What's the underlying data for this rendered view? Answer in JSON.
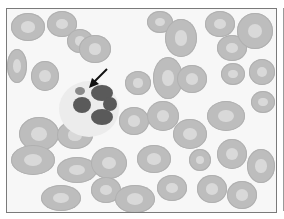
{
  "image": {
    "type": "micrograph",
    "description": "Grayscale blood smear showing red blood cells and a multilobed neutrophil with an arrow pointing to a small body adjacent to the nucleus",
    "annotation": {
      "kind": "arrow",
      "target": "small-inclusion-near-neutrophil"
    },
    "colors": {
      "background": "#f7f7f7",
      "rbc": "#bdbdbd",
      "nucleus": "#5a5a5a",
      "frame": "#7a7a7a"
    }
  },
  "cells": [
    {
      "x": 4,
      "y": 4,
      "w": 34,
      "h": 28
    },
    {
      "x": 40,
      "y": 2,
      "w": 30,
      "h": 26
    },
    {
      "x": 60,
      "y": 20,
      "w": 26,
      "h": 24
    },
    {
      "x": 72,
      "y": 26,
      "w": 32,
      "h": 28
    },
    {
      "x": 0,
      "y": 40,
      "w": 20,
      "h": 34
    },
    {
      "x": 24,
      "y": 52,
      "w": 28,
      "h": 30
    },
    {
      "x": 140,
      "y": 2,
      "w": 26,
      "h": 22
    },
    {
      "x": 158,
      "y": 10,
      "w": 32,
      "h": 38
    },
    {
      "x": 198,
      "y": 2,
      "w": 30,
      "h": 26
    },
    {
      "x": 210,
      "y": 26,
      "w": 30,
      "h": 26
    },
    {
      "x": 230,
      "y": 4,
      "w": 36,
      "h": 36
    },
    {
      "x": 214,
      "y": 54,
      "w": 24,
      "h": 22
    },
    {
      "x": 242,
      "y": 50,
      "w": 26,
      "h": 26
    },
    {
      "x": 244,
      "y": 82,
      "w": 24,
      "h": 22
    },
    {
      "x": 118,
      "y": 62,
      "w": 26,
      "h": 24
    },
    {
      "x": 146,
      "y": 48,
      "w": 30,
      "h": 42
    },
    {
      "x": 170,
      "y": 56,
      "w": 30,
      "h": 28
    },
    {
      "x": 112,
      "y": 98,
      "w": 30,
      "h": 28
    },
    {
      "x": 140,
      "y": 92,
      "w": 32,
      "h": 30
    },
    {
      "x": 200,
      "y": 92,
      "w": 38,
      "h": 30
    },
    {
      "x": 166,
      "y": 110,
      "w": 34,
      "h": 30
    },
    {
      "x": 12,
      "y": 108,
      "w": 40,
      "h": 34
    },
    {
      "x": 50,
      "y": 112,
      "w": 36,
      "h": 28
    },
    {
      "x": 4,
      "y": 136,
      "w": 44,
      "h": 30
    },
    {
      "x": 50,
      "y": 148,
      "w": 40,
      "h": 26
    },
    {
      "x": 84,
      "y": 138,
      "w": 36,
      "h": 32
    },
    {
      "x": 84,
      "y": 168,
      "w": 30,
      "h": 26
    },
    {
      "x": 130,
      "y": 136,
      "w": 34,
      "h": 28
    },
    {
      "x": 182,
      "y": 140,
      "w": 22,
      "h": 22
    },
    {
      "x": 210,
      "y": 130,
      "w": 30,
      "h": 30
    },
    {
      "x": 240,
      "y": 140,
      "w": 28,
      "h": 34
    },
    {
      "x": 150,
      "y": 166,
      "w": 30,
      "h": 26
    },
    {
      "x": 190,
      "y": 166,
      "w": 30,
      "h": 28
    },
    {
      "x": 34,
      "y": 176,
      "w": 40,
      "h": 26
    },
    {
      "x": 108,
      "y": 176,
      "w": 40,
      "h": 28
    },
    {
      "x": 220,
      "y": 172,
      "w": 30,
      "h": 28
    }
  ],
  "neutrophil": {
    "halo": {
      "x": 52,
      "y": 72,
      "w": 60,
      "h": 56
    },
    "lobes": [
      {
        "x": 84,
        "y": 76,
        "w": 22,
        "h": 16
      },
      {
        "x": 66,
        "y": 88,
        "w": 18,
        "h": 16
      },
      {
        "x": 96,
        "y": 88,
        "w": 14,
        "h": 14
      },
      {
        "x": 84,
        "y": 100,
        "w": 22,
        "h": 16
      },
      {
        "x": 68,
        "y": 78,
        "w": 10,
        "h": 8
      }
    ]
  }
}
